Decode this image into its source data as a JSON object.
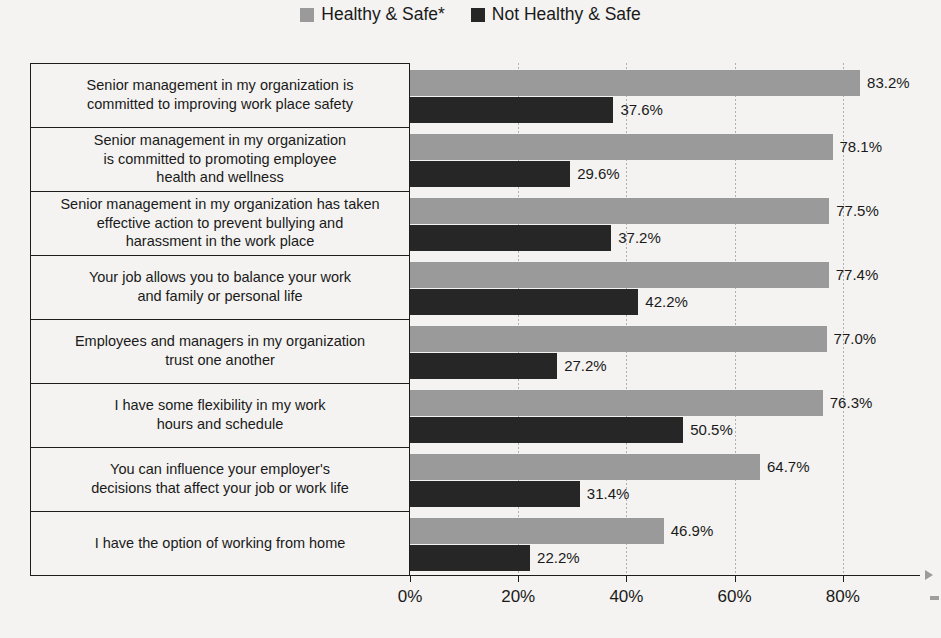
{
  "legend": {
    "items": [
      {
        "label": "Healthy & Safe*",
        "color": "#9a9a9a",
        "icon": "legend-swatch-icon"
      },
      {
        "label": "Not Healthy & Safe",
        "color": "#262626",
        "icon": "legend-swatch-icon"
      }
    ]
  },
  "axis": {
    "ticks": [
      "0%",
      "20%",
      "40%",
      "60%",
      "80%"
    ],
    "tick_values": [
      0,
      20,
      40,
      60,
      80
    ]
  },
  "colors": {
    "series_a": "#9a9a9a",
    "series_b": "#262626",
    "background": "#f4f3f1",
    "frame": "#1d1d1d",
    "gridline": "#b2b1ae"
  },
  "chart_data": {
    "type": "bar",
    "orientation": "horizontal",
    "title": "",
    "xlabel": "",
    "ylabel": "",
    "xlim": [
      0,
      100
    ],
    "grid": true,
    "legend_position": "top-center",
    "categories": [
      "Senior management in my organization is\ncommitted to improving work place safety",
      "Senior management in my organization\nis committed to promoting employee\nhealth and wellness",
      "Senior management in my organization has taken\neffective action to prevent bullying and\nharassment in the work place",
      "Your job allows you to balance your work\nand family or personal life",
      "Employees and managers in my organization\ntrust one another",
      "I have some flexibility in my work\nhours and schedule",
      "You can influence your employer's\ndecisions that affect your job or work life",
      "I have the option of working from home"
    ],
    "series": [
      {
        "name": "Healthy & Safe*",
        "color": "#9a9a9a",
        "values": [
          83.2,
          78.1,
          77.5,
          77.4,
          77.0,
          76.3,
          64.7,
          46.9
        ],
        "labels": [
          "83.2%",
          "78.1%",
          "77.5%",
          "77.4%",
          "77.0%",
          "76.3%",
          "64.7%",
          "46.9%"
        ]
      },
      {
        "name": "Not Healthy & Safe",
        "color": "#262626",
        "values": [
          37.6,
          29.6,
          37.2,
          42.2,
          27.2,
          50.5,
          31.4,
          22.2
        ],
        "labels": [
          "37.6%",
          "29.6%",
          "37.2%",
          "42.2%",
          "27.2%",
          "50.5%",
          "31.4%",
          "22.2%"
        ]
      }
    ]
  }
}
